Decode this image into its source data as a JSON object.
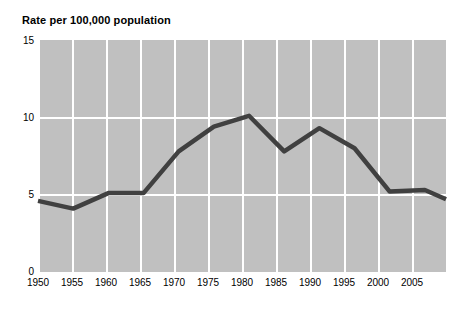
{
  "chart_data": {
    "type": "line",
    "title": "Rate per 100,000 population",
    "xlabel": "",
    "ylabel": "Rate per 100,000 population",
    "ylim": [
      0,
      15
    ],
    "yticks": [
      0,
      5,
      10,
      15
    ],
    "ytick_labels": [
      "0",
      "5",
      "10",
      "15"
    ],
    "xlim": [
      1950,
      2008
    ],
    "xticks": [
      1950,
      1955,
      1960,
      1965,
      1970,
      1975,
      1980,
      1985,
      1990,
      1995,
      2000,
      2005
    ],
    "xtick_labels": [
      "1950",
      "1955",
      "1960",
      "1965",
      "1970",
      "1975",
      "1980",
      "1985",
      "1990",
      "1995",
      "2000",
      "2005"
    ],
    "grid": true,
    "grid_color": "#ffffff",
    "plot_background": "#c0c0c0",
    "line_color": "#404040",
    "line_width": 4,
    "legend": null,
    "x": [
      1950,
      1955,
      1960,
      1965,
      1970,
      1975,
      1980,
      1985,
      1990,
      1995,
      2000,
      2005,
      2008
    ],
    "values": [
      4.6,
      4.1,
      5.1,
      5.1,
      7.8,
      9.4,
      10.1,
      7.8,
      9.3,
      8.0,
      5.2,
      5.3,
      4.7
    ],
    "series": [
      {
        "name": "Rate per 100,000 population",
        "values": [
          4.6,
          4.1,
          5.1,
          5.1,
          7.8,
          9.4,
          10.1,
          7.8,
          9.3,
          8.0,
          5.2,
          5.3,
          4.7
        ]
      }
    ]
  }
}
